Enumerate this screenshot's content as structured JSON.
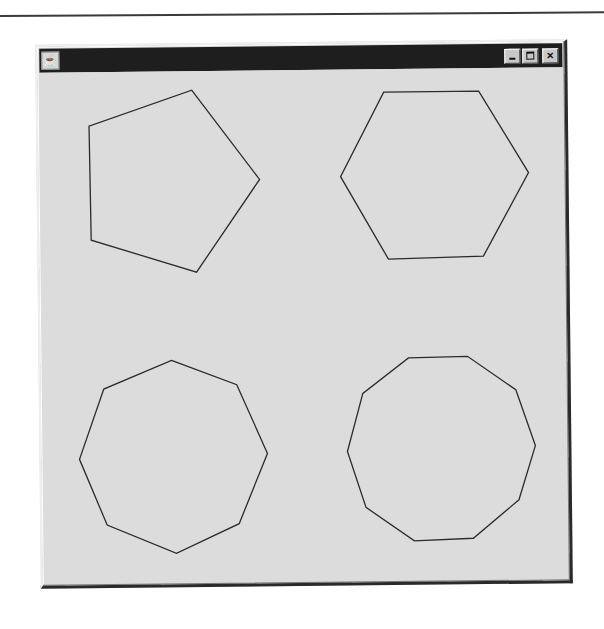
{
  "window": {
    "title": "",
    "icon": "java-coffee-cup-icon",
    "controls": {
      "minimize": "minimize",
      "maximize": "maximize",
      "close": "×"
    }
  },
  "colors": {
    "titlebar": "#1e1e1e",
    "canvas_background": "#dcdcdc",
    "stroke": "#2b2b2b"
  },
  "shapes": [
    {
      "name": "pentagon",
      "sides": 5,
      "points": "194,89 261,179 197,271 92,238 91,124"
    },
    {
      "name": "hexagon",
      "sides": 6,
      "points": "386,93 481,93 530,175 484,258 389,260 342,177"
    },
    {
      "name": "octagon",
      "sides": 8,
      "points": "171,359 236,384 266,453 237,523 174,552 105,523 78,457 103,387"
    },
    {
      "name": "decagon",
      "sides": 10,
      "points": "408,359 467,358 515,392 534,448 517,502 471,540 412,542 364,508 346,452 362,394"
    }
  ]
}
